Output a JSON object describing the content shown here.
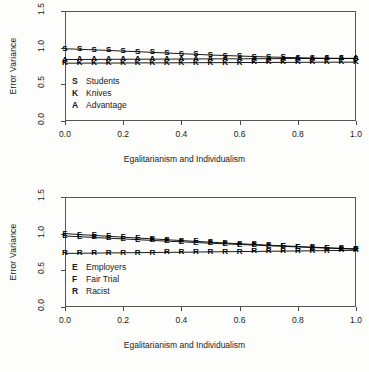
{
  "chart_data": [
    {
      "type": "line",
      "panel": "top",
      "title": "",
      "xlabel": "Egalitarianism and Individualism",
      "ylabel": "Error Variance",
      "xlim": [
        0.0,
        1.0
      ],
      "ylim": [
        0.0,
        1.5
      ],
      "xticks": [
        "0.0",
        "0.2",
        "0.4",
        "0.6",
        "0.8",
        "1.0"
      ],
      "xtick_values": [
        0.0,
        0.2,
        0.4,
        0.6,
        0.8,
        1.0
      ],
      "yticks": [
        "0.0",
        "0.5",
        "1.0",
        "1.5"
      ],
      "ytick_values": [
        0.0,
        0.5,
        1.0,
        1.5
      ],
      "grid": false,
      "legend_position": "inside-left",
      "x": [
        0.0,
        0.05,
        0.1,
        0.15,
        0.2,
        0.25,
        0.3,
        0.35,
        0.4,
        0.45,
        0.5,
        0.55,
        0.6,
        0.65,
        0.7,
        0.75,
        0.8,
        0.85,
        0.9,
        0.95,
        1.0
      ],
      "series": [
        {
          "name": "Students",
          "symbol": "S",
          "values": [
            0.985,
            0.978,
            0.97,
            0.962,
            0.953,
            0.945,
            0.936,
            0.927,
            0.918,
            0.909,
            0.9,
            0.893,
            0.886,
            0.879,
            0.873,
            0.868,
            0.863,
            0.859,
            0.856,
            0.853,
            0.851
          ]
        },
        {
          "name": "Advantage",
          "symbol": "A",
          "values": [
            0.838,
            0.839,
            0.84,
            0.841,
            0.842,
            0.843,
            0.843,
            0.844,
            0.845,
            0.846,
            0.847,
            0.848,
            0.848,
            0.849,
            0.85,
            0.851,
            0.852,
            0.852,
            0.853,
            0.854,
            0.855
          ]
        },
        {
          "name": "Knives",
          "symbol": "K",
          "values": [
            0.788,
            0.789,
            0.79,
            0.79,
            0.791,
            0.792,
            0.793,
            0.793,
            0.794,
            0.795,
            0.796,
            0.796,
            0.797,
            0.798,
            0.799,
            0.799,
            0.8,
            0.801,
            0.802,
            0.802,
            0.803
          ]
        }
      ],
      "legend": [
        {
          "symbol": "S",
          "label": "Students"
        },
        {
          "symbol": "K",
          "label": "Knives"
        },
        {
          "symbol": "A",
          "label": "Advantage"
        }
      ]
    },
    {
      "type": "line",
      "panel": "bottom",
      "title": "",
      "xlabel": "Egalitarianism and Individualism",
      "ylabel": "Error Variance",
      "xlim": [
        0.0,
        1.0
      ],
      "ylim": [
        0.0,
        1.5
      ],
      "xticks": [
        "0.0",
        "0.2",
        "0.4",
        "0.6",
        "0.8",
        "1.0"
      ],
      "xtick_values": [
        0.0,
        0.2,
        0.4,
        0.6,
        0.8,
        1.0
      ],
      "yticks": [
        "0.0",
        "0.5",
        "1.0",
        "1.5"
      ],
      "ytick_values": [
        0.0,
        0.5,
        1.0,
        1.5
      ],
      "grid": false,
      "legend_position": "inside-left",
      "x": [
        0.0,
        0.05,
        0.1,
        0.15,
        0.2,
        0.25,
        0.3,
        0.35,
        0.4,
        0.45,
        0.5,
        0.55,
        0.6,
        0.65,
        0.7,
        0.75,
        0.8,
        0.85,
        0.9,
        0.95,
        1.0
      ],
      "series": [
        {
          "name": "Fair Trial",
          "symbol": "F",
          "values": [
            1.0,
            0.988,
            0.976,
            0.964,
            0.952,
            0.94,
            0.929,
            0.917,
            0.906,
            0.895,
            0.884,
            0.873,
            0.863,
            0.853,
            0.843,
            0.834,
            0.825,
            0.816,
            0.808,
            0.8,
            0.792
          ]
        },
        {
          "name": "Employers",
          "symbol": "E",
          "values": [
            0.968,
            0.958,
            0.948,
            0.938,
            0.928,
            0.918,
            0.908,
            0.898,
            0.889,
            0.879,
            0.87,
            0.861,
            0.852,
            0.844,
            0.835,
            0.827,
            0.819,
            0.811,
            0.803,
            0.796,
            0.788
          ]
        },
        {
          "name": "Racist",
          "symbol": "R",
          "values": [
            0.731,
            0.733,
            0.735,
            0.737,
            0.739,
            0.741,
            0.743,
            0.745,
            0.747,
            0.749,
            0.752,
            0.754,
            0.756,
            0.758,
            0.76,
            0.762,
            0.764,
            0.766,
            0.769,
            0.771,
            0.773
          ]
        }
      ],
      "legend": [
        {
          "symbol": "E",
          "label": "Employers"
        },
        {
          "symbol": "F",
          "label": "Fair Trial"
        },
        {
          "symbol": "R",
          "label": "Racist"
        }
      ]
    }
  ]
}
